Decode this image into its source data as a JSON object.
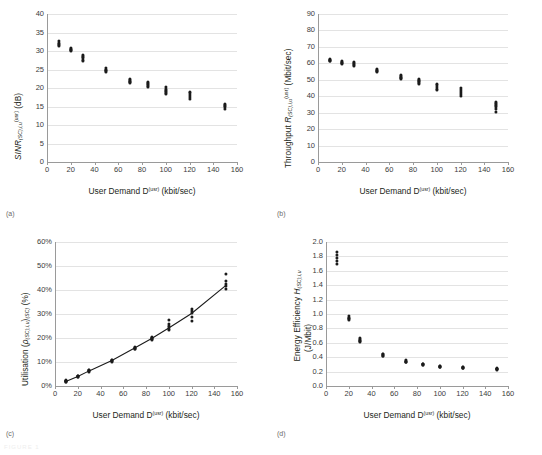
{
  "figure": {
    "panels": [
      "a",
      "b",
      "c",
      "d"
    ],
    "shared_xlabel": "User Demand D(usr) (kbit/sec)",
    "footer": "FIGURE 1"
  },
  "captions": {
    "a": "(a)",
    "b": "(b)",
    "c": "(c)",
    "d": "(d)"
  },
  "chart_data": [
    {
      "panel": "a",
      "type": "scatter",
      "title": "",
      "xlabel": "User Demand D(usr) (kbit/sec)",
      "ylabel": "SINR(SC),i,u(usr) (dB)",
      "ylabel_parts": {
        "main": "SINR",
        "sub": "(SC),i,u",
        "sup": "(usr)",
        "unit": " (dB)"
      },
      "xlabel_parts": {
        "main": "User Demand D",
        "sup": "(usr)",
        "unit": " (kbit/sec)"
      },
      "xlim": [
        0,
        160
      ],
      "ylim": [
        0,
        40
      ],
      "xticks": [
        0,
        20,
        40,
        60,
        80,
        100,
        120,
        140,
        160
      ],
      "yticks": [
        0,
        5,
        10,
        15,
        20,
        25,
        30,
        35,
        40
      ],
      "grid": true,
      "legend": "none",
      "x": [
        10,
        20,
        30,
        50,
        70,
        85,
        100,
        120,
        150
      ],
      "clusters": [
        {
          "x": 10,
          "values": [
            32.6,
            32.2,
            31.9,
            31.6,
            31.4
          ]
        },
        {
          "x": 20,
          "values": [
            30.9,
            30.6,
            30.4,
            30.2,
            30.0
          ]
        },
        {
          "x": 30,
          "values": [
            28.8,
            28.5,
            28.1,
            27.6,
            27.3
          ]
        },
        {
          "x": 50,
          "values": [
            25.3,
            25.0,
            24.8,
            24.6,
            24.4
          ]
        },
        {
          "x": 70,
          "values": [
            22.4,
            22.1,
            21.9,
            21.7,
            21.5
          ]
        },
        {
          "x": 85,
          "values": [
            21.7,
            21.4,
            21.1,
            20.7,
            20.3
          ]
        },
        {
          "x": 100,
          "values": [
            20.2,
            19.6,
            19.2,
            18.8,
            18.4
          ]
        },
        {
          "x": 120,
          "values": [
            19.0,
            18.6,
            18.2,
            17.6,
            17.0
          ]
        },
        {
          "x": 150,
          "values": [
            15.8,
            15.5,
            15.2,
            14.8,
            14.3
          ]
        }
      ]
    },
    {
      "panel": "b",
      "type": "scatter",
      "title": "",
      "xlabel": "User Demand D(usr) (kbit/sec)",
      "ylabel": "Throughput R(SC),i,u(usr) (Mbit/sec)",
      "ylabel_parts": {
        "main": "Throughput ",
        "sym": "R",
        "sub": "(SC),i,u",
        "sup": "(usr)",
        "unit": " (Mbit/sec)"
      },
      "xlabel_parts": {
        "main": "User Demand D",
        "sup": "(usr)",
        "unit": " (kbit/sec)"
      },
      "xlim": [
        0,
        160
      ],
      "ylim": [
        0,
        90
      ],
      "xticks": [
        0,
        20,
        40,
        60,
        80,
        100,
        120,
        140,
        160
      ],
      "yticks": [
        0,
        10,
        20,
        30,
        40,
        50,
        60,
        70,
        80,
        90
      ],
      "grid": true,
      "legend": "none",
      "x": [
        10,
        20,
        30,
        50,
        70,
        85,
        100,
        120,
        150
      ],
      "clusters": [
        {
          "x": 10,
          "values": [
            62.6,
            62.2,
            61.9,
            61.6,
            61.3
          ]
        },
        {
          "x": 20,
          "values": [
            61.6,
            61.0,
            60.5,
            60.0,
            59.6
          ]
        },
        {
          "x": 30,
          "values": [
            61.0,
            60.4,
            59.8,
            59.2,
            58.6
          ]
        },
        {
          "x": 50,
          "values": [
            56.4,
            55.9,
            55.5,
            55.1,
            54.7
          ]
        },
        {
          "x": 70,
          "values": [
            53.2,
            52.5,
            51.9,
            51.3,
            50.8
          ]
        },
        {
          "x": 85,
          "values": [
            50.3,
            49.6,
            49.0,
            48.3,
            47.7
          ]
        },
        {
          "x": 100,
          "values": [
            47.6,
            46.6,
            45.6,
            44.6,
            43.6
          ]
        },
        {
          "x": 120,
          "values": [
            45.0,
            43.8,
            42.6,
            41.4,
            40.2
          ]
        },
        {
          "x": 150,
          "values": [
            36.2,
            35.0,
            33.8,
            32.2,
            30.5
          ]
        }
      ]
    },
    {
      "panel": "c",
      "type": "line",
      "title": "",
      "xlabel": "User Demand D(usr) (kbit/sec)",
      "ylabel": "Utilisation (ρ(SC),i,u)(SC) (%)",
      "ylabel_parts": {
        "main": "Utilisation (",
        "sym": "ρ",
        "sub": "(SC),i,u",
        "close": ")",
        "sub2": "(SC)",
        "unit": " (%)"
      },
      "xlabel_parts": {
        "main": "User Demand D",
        "sup": "(usr)",
        "unit": " (kbit/sec)"
      },
      "xlim": [
        0,
        160
      ],
      "ylim": [
        0,
        60
      ],
      "xticks": [
        0,
        20,
        40,
        60,
        80,
        100,
        120,
        140,
        160
      ],
      "yticks": [
        "0%",
        "10%",
        "20%",
        "30%",
        "40%",
        "50%",
        "60%"
      ],
      "ytick_values": [
        0,
        10,
        20,
        30,
        40,
        50,
        60
      ],
      "grid": true,
      "legend": "none",
      "x": [
        10,
        20,
        30,
        50,
        70,
        85,
        100,
        120,
        150
      ],
      "line_values": [
        2.0,
        4.0,
        6.3,
        10.6,
        15.8,
        19.8,
        24.2,
        30.2,
        41.8
      ],
      "clusters": [
        {
          "x": 10,
          "values": [
            2.3,
            2.1,
            2.0,
            1.9,
            1.8
          ]
        },
        {
          "x": 20,
          "values": [
            4.3,
            4.1,
            4.0,
            3.9,
            3.8
          ]
        },
        {
          "x": 30,
          "values": [
            6.7,
            6.5,
            6.3,
            6.1,
            6.0
          ]
        },
        {
          "x": 50,
          "values": [
            11.0,
            10.8,
            10.6,
            10.4,
            10.2
          ]
        },
        {
          "x": 70,
          "values": [
            16.3,
            16.0,
            15.8,
            15.5,
            15.3
          ]
        },
        {
          "x": 85,
          "values": [
            20.4,
            20.1,
            19.8,
            19.5,
            19.2
          ]
        },
        {
          "x": 100,
          "values": [
            27.7,
            26.0,
            24.8,
            23.9,
            23.2
          ]
        },
        {
          "x": 120,
          "values": [
            32.2,
            31.2,
            30.3,
            28.6,
            27.1
          ]
        },
        {
          "x": 150,
          "values": [
            46.8,
            43.6,
            42.6,
            41.6,
            40.3
          ]
        }
      ]
    },
    {
      "panel": "d",
      "type": "scatter",
      "title": "",
      "xlabel": "User Demand D(usr) (kbit/sec)",
      "ylabel": "Energy Efficiency H(SC),i,u (J/Mbit)",
      "ylabel_parts": {
        "main": "Energy Efficiency ",
        "sym": "H",
        "sub": "(SC),i,u",
        "unit": "(J/Mbit)"
      },
      "xlabel_parts": {
        "main": "User Demand D",
        "sup": "(usr)",
        "unit": " (kbit/sec)"
      },
      "xlim": [
        0,
        160
      ],
      "ylim": [
        0.0,
        2.0
      ],
      "xticks": [
        0,
        20,
        40,
        60,
        80,
        100,
        120,
        140,
        160
      ],
      "yticks": [
        "0.0",
        "0.2",
        "0.4",
        "0.6",
        "0.8",
        "1.0",
        "1.2",
        "1.4",
        "1.6",
        "1.8",
        "2.0"
      ],
      "ytick_values": [
        0.0,
        0.2,
        0.4,
        0.6,
        0.8,
        1.0,
        1.2,
        1.4,
        1.6,
        1.8,
        2.0
      ],
      "grid": true,
      "legend": "none",
      "x": [
        10,
        20,
        30,
        50,
        70,
        85,
        100,
        120,
        150
      ],
      "clusters": [
        {
          "x": 10,
          "values": [
            1.86,
            1.82,
            1.78,
            1.74,
            1.7
          ]
        },
        {
          "x": 20,
          "values": [
            0.97,
            0.95,
            0.94,
            0.93,
            0.92
          ]
        },
        {
          "x": 30,
          "values": [
            0.66,
            0.64,
            0.63,
            0.62,
            0.61
          ]
        },
        {
          "x": 50,
          "values": [
            0.45,
            0.44,
            0.43,
            0.42,
            0.42
          ]
        },
        {
          "x": 70,
          "values": [
            0.36,
            0.35,
            0.34,
            0.34,
            0.33
          ]
        },
        {
          "x": 85,
          "values": [
            0.31,
            0.3,
            0.3,
            0.29,
            0.29
          ]
        },
        {
          "x": 100,
          "values": [
            0.28,
            0.28,
            0.27,
            0.27,
            0.27
          ]
        },
        {
          "x": 120,
          "values": [
            0.26,
            0.26,
            0.25,
            0.25,
            0.25
          ]
        },
        {
          "x": 150,
          "values": [
            0.25,
            0.24,
            0.24,
            0.24,
            0.23
          ]
        }
      ]
    }
  ]
}
